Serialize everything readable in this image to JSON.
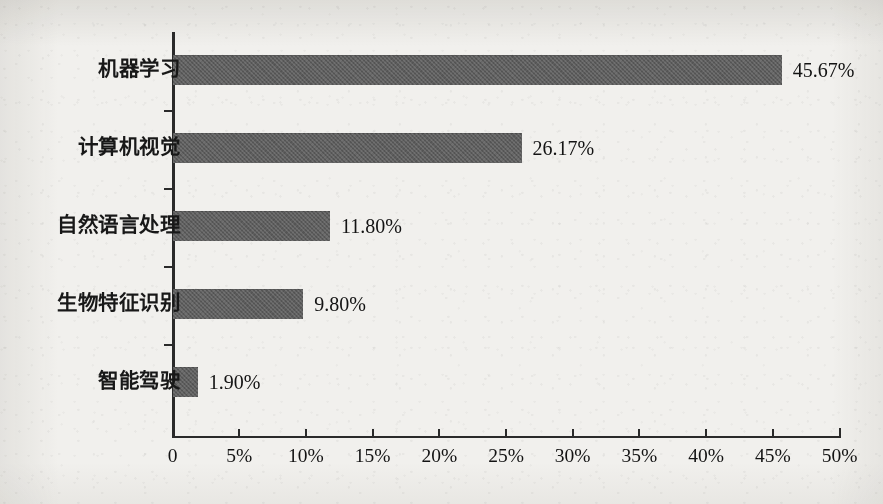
{
  "chart_data": {
    "type": "bar",
    "orientation": "horizontal",
    "title": "",
    "subtitle": "",
    "xlabel": "",
    "ylabel": "",
    "categories": [
      "机器学习",
      "计算机视觉",
      "自然语言处理",
      "生物特征识别",
      "智能驾驶"
    ],
    "values": [
      45.67,
      26.17,
      11.8,
      9.8,
      1.9
    ],
    "value_labels": [
      "45.67%",
      "26.17%",
      "11.80%",
      "9.80%",
      "1.90%"
    ],
    "xlim": [
      0,
      50
    ],
    "xtick_values": [
      0,
      5,
      10,
      15,
      20,
      25,
      30,
      35,
      40,
      45,
      50
    ],
    "xtick_labels": [
      "0",
      "5%",
      "10%",
      "15%",
      "20%",
      "25%",
      "30%",
      "35%",
      "40%",
      "45%",
      "50%"
    ],
    "grid": false,
    "legend": false,
    "legend_position": "none",
    "series": [
      {
        "name": "",
        "values": [
          45.67,
          26.17,
          11.8,
          9.8,
          1.9
        ]
      }
    ],
    "colors": {
      "bar_fill": "#5e5e5e",
      "axis": "#2a2a2a",
      "text": "#131313",
      "background": "#f1f0ed"
    }
  }
}
